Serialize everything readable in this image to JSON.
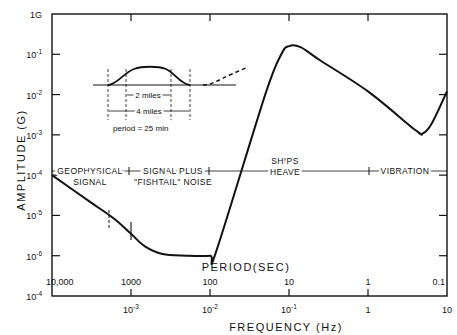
{
  "chart_data": {
    "type": "line",
    "title": "",
    "xlabel": "FREQUENCY (Hz)",
    "x2label": "PERIOD(SEC)",
    "ylabel": "AMPLITUDE (G)",
    "xscale": "log",
    "yscale": "log",
    "xlim": [
      0.0001,
      10
    ],
    "ylim": [
      1e-07,
      1
    ],
    "grid": false,
    "x_ticks": [
      {
        "value": 0.001,
        "label": "10",
        "exp": "-3"
      },
      {
        "value": 0.01,
        "label": "10",
        "exp": "-2"
      },
      {
        "value": 0.1,
        "label": "10",
        "exp": "-1"
      },
      {
        "value": 1,
        "label": "1",
        "exp": ""
      },
      {
        "value": 10,
        "label": "10",
        "exp": ""
      }
    ],
    "x_origin_label": {
      "label": "10",
      "exp": "-4"
    },
    "period_ticks": [
      {
        "value": 0.0001,
        "label": "10,000"
      },
      {
        "value": 0.001,
        "label": "1000"
      },
      {
        "value": 0.01,
        "label": "100"
      },
      {
        "value": 0.1,
        "label": "10"
      },
      {
        "value": 1,
        "label": "1"
      },
      {
        "value": 10,
        "label": "0.1"
      }
    ],
    "y_ticks": [
      {
        "value": 1,
        "label": "1G",
        "exp": ""
      },
      {
        "value": 0.1,
        "label": "10",
        "exp": "-1"
      },
      {
        "value": 0.01,
        "label": "10",
        "exp": "-2"
      },
      {
        "value": 0.001,
        "label": "10",
        "exp": "-3"
      },
      {
        "value": 0.0001,
        "label": "10",
        "exp": "-4"
      },
      {
        "value": 1e-05,
        "label": "10",
        "exp": "-5"
      },
      {
        "value": 1e-06,
        "label": "10",
        "exp": "-6"
      }
    ],
    "series": [
      {
        "name": "acceptable signal amplitude",
        "points": [
          [
            0.0001,
            0.0001
          ],
          [
            0.0003,
            2.2e-05
          ],
          [
            0.0006,
            8.5e-06
          ],
          [
            0.001,
            3.5e-06
          ],
          [
            0.0015,
            1.7e-06
          ],
          [
            0.0025,
            1.1e-06
          ],
          [
            0.005,
            1e-06
          ],
          [
            0.01,
            1e-06
          ],
          [
            0.012,
            1.3e-06
          ],
          [
            0.05,
            0.01
          ],
          [
            0.08,
            0.1
          ],
          [
            0.1,
            0.16
          ],
          [
            0.14,
            0.15
          ],
          [
            0.25,
            0.07
          ],
          [
            1,
            0.012
          ],
          [
            4,
            0.0013
          ],
          [
            5,
            0.0011
          ],
          [
            6.5,
            0.002
          ],
          [
            10,
            0.012
          ]
        ]
      }
    ],
    "regions": [
      {
        "label": "GEOPHYSICAL SIGNAL",
        "from": 0.0001,
        "to": 0.0006
      },
      {
        "label": "SIGNAL PLUS \"FISHTAIL\" NOISE",
        "from": 0.0006,
        "to": 0.01
      },
      {
        "label": "SHIPS HEAVE",
        "from": 0.01,
        "to": 1
      },
      {
        "label": "VIBRATION",
        "from": 1,
        "to": 10
      }
    ],
    "inset": {
      "label_inner": "2 miles",
      "label_outer": "4 miles",
      "caption": "period = 25 min"
    }
  }
}
